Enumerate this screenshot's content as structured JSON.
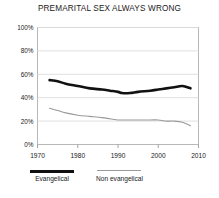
{
  "chart_data": {
    "type": "line",
    "title": "PREMARITAL SEX ALWAYS WRONG",
    "xlabel": "",
    "ylabel": "",
    "xlim": [
      1970,
      2010
    ],
    "ylim": [
      0,
      100
    ],
    "grid": true,
    "legend_position": "bottom-left",
    "x_ticks": [
      "1970",
      "1980",
      "1990",
      "2000",
      "2010"
    ],
    "y_ticks": [
      "0%",
      "20%",
      "40%",
      "60%",
      "80%",
      "100%"
    ],
    "series": [
      {
        "name": "Evangelical",
        "color": "#111111",
        "x": [
          1973,
          1975,
          1977,
          1980,
          1983,
          1986,
          1988,
          1990,
          1991,
          1993,
          1995,
          1998,
          2000,
          2002,
          2004,
          2006,
          2008
        ],
        "values": [
          55,
          54,
          52,
          50,
          48,
          47,
          46,
          45,
          44,
          44,
          45,
          46,
          47,
          48,
          49,
          50,
          48
        ]
      },
      {
        "name": "Non evangelical",
        "color": "#9a9a9a",
        "x": [
          1973,
          1975,
          1977,
          1980,
          1983,
          1986,
          1988,
          1990,
          1991,
          1993,
          1995,
          1998,
          2000,
          2002,
          2004,
          2006,
          2008
        ],
        "values": [
          31,
          29,
          27,
          25,
          24,
          23,
          22,
          21,
          21,
          21,
          21,
          21,
          21,
          20,
          20,
          19,
          16
        ]
      }
    ]
  },
  "legend": {
    "items": [
      {
        "label": "Evangelical"
      },
      {
        "label": "Non evangelical"
      }
    ]
  },
  "axis": {
    "y": {
      "labels": [
        "100%",
        "80%",
        "60%",
        "40%",
        "20%",
        "0%"
      ]
    },
    "x": {
      "labels": [
        "1970",
        "1980",
        "1990",
        "2000",
        "2010"
      ]
    }
  }
}
